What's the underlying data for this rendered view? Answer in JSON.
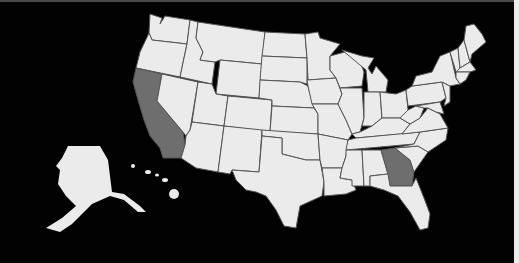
{
  "map": {
    "title": "",
    "region": "United States",
    "colors": {
      "background": "#000000",
      "state_default": "#ebebeb",
      "state_highlighted": "#6e6e6e",
      "border": "#555555"
    },
    "highlighted_states": [
      "California",
      "Georgia"
    ],
    "insets": [
      "Alaska",
      "Hawaii"
    ]
  }
}
